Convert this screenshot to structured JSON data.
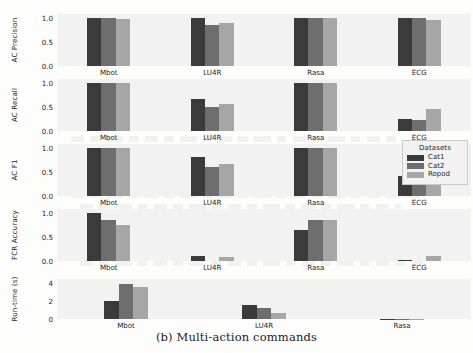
{
  "caption": "(b) Multi-action commands",
  "legend": {
    "title": "Datasets",
    "entries": [
      {
        "label": "Cat1",
        "color": "#3b3b3b"
      },
      {
        "label": "Cat2",
        "color": "#6e6e6e"
      },
      {
        "label": "Ropod",
        "color": "#a6a6a6"
      }
    ]
  },
  "chart_data": {
    "type": "bar",
    "title": "(b) Multi-action commands",
    "xlabel": "",
    "grid": false,
    "legend_position": "right",
    "legend_title": "Datasets",
    "series_names": [
      "Cat1",
      "Cat2",
      "Ropod"
    ],
    "series_colors": [
      "#3b3b3b",
      "#6e6e6e",
      "#a6a6a6"
    ],
    "subplots": [
      {
        "ylabel": "AC Precision",
        "categories": [
          "Mbot",
          "LU4R",
          "Rasa",
          "ECG"
        ],
        "yticks": [
          "0.0",
          "0.5",
          "1.0"
        ],
        "ytickvals": [
          0.0,
          0.5,
          1.0
        ],
        "ylim": [
          0.0,
          1.08
        ],
        "series": [
          {
            "name": "Cat1",
            "values": [
              1.0,
              1.0,
              1.0,
              1.0
            ]
          },
          {
            "name": "Cat2",
            "values": [
              1.0,
              0.85,
              1.0,
              1.0
            ]
          },
          {
            "name": "Ropod",
            "values": [
              0.97,
              0.89,
              1.0,
              0.96
            ]
          }
        ]
      },
      {
        "ylabel": "AC Recall",
        "categories": [
          "Mbot",
          "LU4R",
          "Rasa",
          "ECG"
        ],
        "yticks": [
          "0.0",
          "0.5",
          "1.0"
        ],
        "ytickvals": [
          0.0,
          0.5,
          1.0
        ],
        "ylim": [
          0.0,
          1.08
        ],
        "series": [
          {
            "name": "Cat1",
            "values": [
              1.0,
              0.67,
              1.0,
              0.25
            ]
          },
          {
            "name": "Cat2",
            "values": [
              1.0,
              0.49,
              1.0,
              0.23
            ]
          },
          {
            "name": "Ropod",
            "values": [
              1.0,
              0.57,
              1.0,
              0.45
            ]
          }
        ]
      },
      {
        "ylabel": "AC F1",
        "categories": [
          "Mbot",
          "LU4R",
          "Rasa",
          "ECG"
        ],
        "yticks": [
          "0.0",
          "0.5",
          "1.0"
        ],
        "ytickvals": [
          0.0,
          0.5,
          1.0
        ],
        "ylim": [
          0.0,
          1.08
        ],
        "series": [
          {
            "name": "Cat1",
            "values": [
              1.0,
              0.8,
              1.0,
              0.42
            ]
          },
          {
            "name": "Cat2",
            "values": [
              1.0,
              0.6,
              1.0,
              0.37
            ]
          },
          {
            "name": "Ropod",
            "values": [
              1.0,
              0.66,
              1.0,
              0.57
            ]
          }
        ]
      },
      {
        "ylabel": "FCR Accuracy",
        "categories": [
          "Mbot",
          "LU4R",
          "Rasa",
          "ECG"
        ],
        "yticks": [
          "0.0",
          "0.5",
          "1.0"
        ],
        "ytickvals": [
          0.0,
          0.5,
          1.0
        ],
        "ylim": [
          0.0,
          1.08
        ],
        "series": [
          {
            "name": "Cat1",
            "values": [
              1.0,
              0.11,
              0.65,
              0.02
            ]
          },
          {
            "name": "Cat2",
            "values": [
              0.85,
              0.0,
              0.85,
              0.0
            ]
          },
          {
            "name": "Ropod",
            "values": [
              0.74,
              0.09,
              0.85,
              0.1
            ]
          }
        ]
      },
      {
        "ylabel": "Run-time (s)",
        "categories": [
          "Mbot",
          "LU4R",
          "Rasa"
        ],
        "yticks": [
          "0",
          "2",
          "4"
        ],
        "ytickvals": [
          0,
          2,
          4
        ],
        "ylim": [
          0,
          4.4
        ],
        "series": [
          {
            "name": "Cat1",
            "values": [
              2.0,
              1.5,
              0.04
            ]
          },
          {
            "name": "Cat2",
            "values": [
              3.9,
              1.2,
              0.03
            ]
          },
          {
            "name": "Ropod",
            "values": [
              3.5,
              0.65,
              0.03
            ]
          }
        ]
      }
    ]
  }
}
